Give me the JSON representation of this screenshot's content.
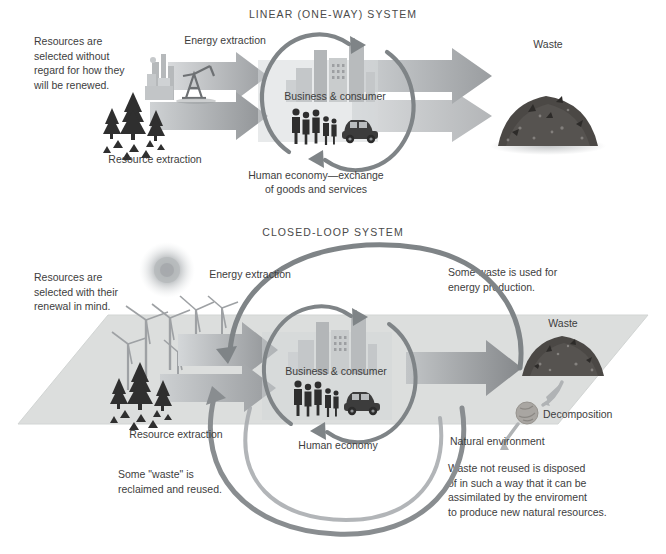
{
  "palette": {
    "text": "#3d3d3d",
    "title": "#4a4a4a",
    "arrow_dark": "#8a8d90",
    "arrow_mid": "#a8abae",
    "arrow_light": "#c9ccce",
    "plane": "#dcdedd",
    "plane_edge": "#cfd2d1",
    "loop_arrow": "#7f8487",
    "waste_dark": "#4a4744",
    "building": "#b9bcbe",
    "tree": "#2f2f2f",
    "page_bg": "#ffffff"
  },
  "linear": {
    "title": "LINEAR (ONE-WAY) SYSTEM",
    "note_left": "Resources are\nselected without\nregard for how they\nwill be renewed.",
    "label_energy": "Energy extraction",
    "label_resource": "Resource extraction",
    "label_center": "Business & consumer",
    "label_loop": "Human economy—exchange\nof goods and services",
    "label_waste": "Waste"
  },
  "closed": {
    "title": "CLOSED-LOOP SYSTEM",
    "note_left": "Resources are\nselected with their\nrenewal in mind.",
    "label_energy": "Energy extraction",
    "label_resource": "Resource extraction",
    "label_center": "Business & consumer",
    "label_loop": "Human economy",
    "label_waste": "Waste",
    "label_decomposition": "Decomposition",
    "label_natural_environment": "Natural environment",
    "note_energy_reuse": "Some waste is used for\nenergy production.",
    "note_reclaim": "Some \"waste\" is\nreclaimed and reused.",
    "note_disposal": "Waste not reused is disposed\nof in such a way that it can be\nassimilated by the enviroment\nto produce new natural resources."
  }
}
